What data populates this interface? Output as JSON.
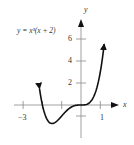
{
  "chart_data": {
    "type": "line",
    "title": "",
    "equation_label": "y = x³(x + 2)",
    "xlabel": "x",
    "ylabel": "y",
    "xlim": [
      -3.2,
      1.5
    ],
    "ylim": [
      -1.8,
      7.5
    ],
    "x_ticks": [
      -3,
      -2,
      -1,
      1
    ],
    "x_tick_labels": {
      "-3": "−3",
      "1": "1"
    },
    "y_ticks": [
      -1,
      2,
      4,
      6
    ],
    "y_tick_labels": {
      "2": "2",
      "4": "4",
      "6": "6"
    },
    "grid": false,
    "series": [
      {
        "name": "y = x^3(x+2)",
        "x": [
          -2.15,
          -2.0,
          -1.9,
          -1.8,
          -1.7,
          -1.6,
          -1.5,
          -1.4,
          -1.3,
          -1.2,
          -1.0,
          -0.8,
          -0.6,
          -0.4,
          -0.2,
          0.0,
          0.2,
          0.4,
          0.6,
          0.8,
          1.0,
          1.1,
          1.2
        ],
        "values": [
          1.49,
          0.0,
          -0.69,
          -1.17,
          -1.47,
          -1.64,
          -1.69,
          -1.65,
          -1.54,
          -1.38,
          -1.0,
          -0.61,
          -0.3,
          -0.1,
          -0.01,
          0.0,
          0.02,
          0.15,
          0.56,
          1.43,
          3.0,
          4.26,
          5.88
        ]
      }
    ],
    "min_point": {
      "x": -1.5,
      "y": -1.69
    },
    "arrows": [
      "both curve ends",
      "positive x-axis",
      "positive y-axis"
    ]
  },
  "labels": {
    "equation": "y = x³(x + 2)",
    "x_axis": "x",
    "y_axis": "y",
    "tick_neg3": "−3",
    "tick_1": "1",
    "tick_2": "2",
    "tick_4": "4",
    "tick_6": "6"
  }
}
